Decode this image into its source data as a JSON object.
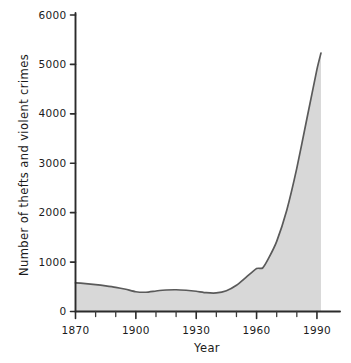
{
  "chart_data": {
    "type": "area",
    "title": "",
    "xlabel": "Year",
    "ylabel": "Number of thefts and violent crimes",
    "xlim": [
      1870,
      1995
    ],
    "ylim": [
      0,
      6000
    ],
    "grid": false,
    "legend": "none",
    "x_ticks_major": [
      1870,
      1900,
      1930,
      1960,
      1990
    ],
    "x_tick_labels": [
      "1870",
      "1900",
      "1930",
      "1960",
      "1990"
    ],
    "x_ticks_minor": [
      1880,
      1890,
      1910,
      1920,
      1940,
      1950,
      1970,
      1980
    ],
    "y_ticks": [
      0,
      1000,
      2000,
      3000,
      4000,
      5000,
      6000
    ],
    "y_tick_labels": [
      "0",
      "1000",
      "2000",
      "3000",
      "4000",
      "5000",
      "6000"
    ],
    "x": [
      1870,
      1875,
      1880,
      1885,
      1890,
      1895,
      1900,
      1905,
      1910,
      1915,
      1920,
      1925,
      1930,
      1935,
      1940,
      1945,
      1950,
      1955,
      1960,
      1963,
      1966,
      1970,
      1975,
      1980,
      1985,
      1990,
      1992
    ],
    "values": [
      580,
      565,
      545,
      520,
      490,
      450,
      400,
      390,
      415,
      435,
      440,
      430,
      410,
      380,
      375,
      420,
      530,
      700,
      870,
      880,
      1080,
      1420,
      2050,
      2900,
      3900,
      4900,
      5230
    ],
    "series_name": "Thefts and violent crimes",
    "fill_color": "#d8d8d8",
    "line_color": "#5a5a5a",
    "axis_color": "#2b2b2b"
  },
  "axis": {
    "x_title": "Year",
    "y_title": "Number of thefts and violent crimes"
  }
}
